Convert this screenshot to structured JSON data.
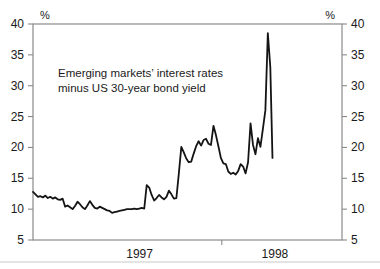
{
  "chart_data": {
    "type": "line",
    "title": "",
    "annotation": "Emerging markets' interest rates\nminus US 30-year bond yield",
    "annotation_line1": "Emerging markets’ interest rates",
    "annotation_line2": "minus US 30-year bond yield",
    "xlabel": "",
    "ylabel": "",
    "unit_left": "%",
    "unit_right": "%",
    "ylim": [
      5,
      40
    ],
    "yticks": [
      5,
      10,
      15,
      20,
      25,
      30,
      35,
      40
    ],
    "ytick_labels_left": [
      "5",
      "10",
      "15",
      "20",
      "25",
      "30",
      "35",
      "40"
    ],
    "ytick_labels_right": [
      "5",
      "10",
      "15",
      "20",
      "25",
      "30",
      "35",
      "40"
    ],
    "xtick_labels": [
      "1997",
      "1998"
    ],
    "xtick_label_positions": [
      0.345,
      0.783
    ],
    "x_boundary_tick": 0.611,
    "grid": false,
    "legend": false,
    "line_color": "#141414",
    "frame_color": "#8a8a8a",
    "background": "#ffffff",
    "x_range_fraction": [
      0.0,
      0.775
    ],
    "series": [
      {
        "name": "Emerging markets' interest rates minus US 30-year bond yield",
        "x": [
          0.0,
          0.008,
          0.016,
          0.024,
          0.032,
          0.04,
          0.048,
          0.056,
          0.064,
          0.072,
          0.08,
          0.088,
          0.096,
          0.104,
          0.112,
          0.12,
          0.128,
          0.136,
          0.144,
          0.152,
          0.16,
          0.168,
          0.176,
          0.184,
          0.192,
          0.2,
          0.208,
          0.216,
          0.224,
          0.232,
          0.24,
          0.248,
          0.256,
          0.264,
          0.272,
          0.28,
          0.288,
          0.296,
          0.304,
          0.312,
          0.32,
          0.328,
          0.336,
          0.344,
          0.352,
          0.36,
          0.368,
          0.376,
          0.384,
          0.392,
          0.4,
          0.408,
          0.416,
          0.424,
          0.432,
          0.44,
          0.448,
          0.456,
          0.464,
          0.472,
          0.48,
          0.488,
          0.496,
          0.504,
          0.512,
          0.52,
          0.528,
          0.536,
          0.544,
          0.552,
          0.56,
          0.568,
          0.576,
          0.584,
          0.592,
          0.6,
          0.608,
          0.616,
          0.624,
          0.632,
          0.64,
          0.648,
          0.656,
          0.664,
          0.672,
          0.68,
          0.688,
          0.696,
          0.704,
          0.712,
          0.72,
          0.728,
          0.736,
          0.744,
          0.752,
          0.76,
          0.768,
          0.775
        ],
        "values": [
          12.8,
          12.4,
          12.0,
          12.1,
          11.9,
          12.2,
          11.8,
          12.0,
          11.7,
          11.9,
          11.6,
          11.5,
          11.7,
          10.4,
          10.6,
          10.3,
          10.0,
          10.5,
          11.2,
          10.8,
          10.3,
          10.0,
          10.6,
          11.3,
          10.7,
          10.2,
          10.1,
          10.4,
          10.2,
          10.0,
          9.8,
          9.7,
          9.4,
          9.5,
          9.6,
          9.7,
          9.8,
          9.9,
          10.0,
          10.0,
          10.0,
          10.1,
          10.0,
          10.1,
          10.2,
          10.1,
          13.9,
          13.5,
          12.3,
          11.4,
          11.8,
          12.3,
          11.9,
          11.6,
          12.0,
          13.0,
          12.4,
          11.7,
          11.8,
          15.8,
          20.1,
          19.2,
          18.2,
          17.6,
          17.7,
          19.0,
          20.2,
          21.0,
          20.3,
          21.2,
          21.4,
          20.6,
          20.4,
          23.5,
          22.0,
          20.2,
          18.3,
          17.4,
          17.3,
          16.1,
          15.7,
          15.9,
          15.6,
          16.2,
          17.3,
          16.9,
          15.8,
          17.6,
          23.9,
          20.4,
          18.9,
          21.5,
          20.1,
          23.0,
          26.0,
          38.5,
          33.0,
          18.3
        ]
      }
    ]
  }
}
